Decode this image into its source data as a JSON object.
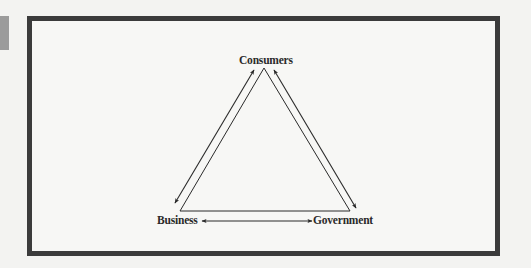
{
  "diagram": {
    "type": "triangle-relationship",
    "nodes": [
      {
        "id": "consumers",
        "label": "Consumers",
        "position": "top"
      },
      {
        "id": "business",
        "label": "Business",
        "position": "bottom-left"
      },
      {
        "id": "government",
        "label": "Government",
        "position": "bottom-right"
      }
    ],
    "edges": [
      {
        "from": "business",
        "to": "consumers",
        "direction": "bidirectional"
      },
      {
        "from": "consumers",
        "to": "government",
        "direction": "bidirectional"
      },
      {
        "from": "business",
        "to": "government",
        "direction": "bidirectional"
      }
    ],
    "colors": {
      "background": "#f3f3f1",
      "frame_border": "#3b3b3b",
      "side_tab": "#9b9b9b",
      "lines": "#2a2a2a"
    }
  }
}
